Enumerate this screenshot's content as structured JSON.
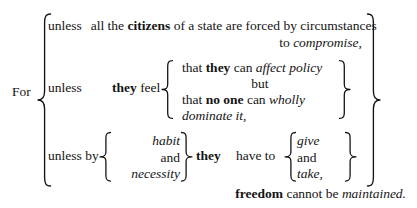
{
  "diagram": {
    "type": "bracketed-sentence-diagram",
    "background_color": "#ffffff",
    "text_color": "#141414",
    "lead_word": "For",
    "closing": {
      "bold_word": "freedom",
      "rest": " cannot be ",
      "italic_tail": "maintained."
    },
    "branches": [
      {
        "id": "branch-1",
        "connective": "unless",
        "line_1": {
          "a": "all the ",
          "bold": "citizens",
          "b": " of a state are forced by circumstances"
        },
        "line_2": {
          "a": "to ",
          "italic": "compromise,"
        }
      },
      {
        "id": "branch-2",
        "connective": "unless",
        "subject_bold": "they",
        "verb": " feel",
        "items": [
          {
            "a": "that ",
            "bold": "they",
            "b": " can ",
            "italic": "affect policy",
            "align": "left"
          },
          {
            "a": "but",
            "align": "center"
          },
          {
            "a": "that ",
            "bold": "no one",
            "b": " can ",
            "italic": "wholly",
            "align": "left"
          },
          {
            "italic": "dominate it,",
            "align": "left"
          }
        ]
      },
      {
        "id": "branch-3",
        "connective": "unless by",
        "left_stack": [
          "habit",
          "and",
          "necessity"
        ],
        "left_stack_styles": [
          "italic",
          "roman",
          "italic"
        ],
        "subject_bold": "they",
        "verb": "have to",
        "right_stack": [
          "give",
          "and",
          "take,"
        ],
        "right_stack_styles": [
          "italic",
          "roman",
          "italic"
        ]
      }
    ],
    "braces": [
      {
        "name": "outer-left-brace",
        "orientation": "left"
      },
      {
        "name": "outer-right-brace",
        "orientation": "right"
      },
      {
        "name": "inner-left-brace-feel",
        "orientation": "left"
      },
      {
        "name": "inner-right-brace-feel",
        "orientation": "right"
      },
      {
        "name": "habit-left-brace",
        "orientation": "left"
      },
      {
        "name": "habit-right-brace",
        "orientation": "right"
      },
      {
        "name": "give-left-brace",
        "orientation": "left"
      },
      {
        "name": "give-right-brace",
        "orientation": "right"
      }
    ]
  }
}
